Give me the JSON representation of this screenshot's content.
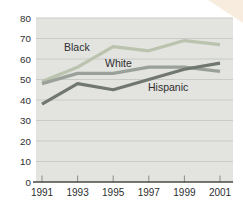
{
  "chart_data": {
    "type": "line",
    "title": "",
    "xlabel": "",
    "ylabel": "",
    "categories": [
      "1991",
      "1993",
      "1995",
      "1997",
      "1999",
      "2001"
    ],
    "series": [
      {
        "name": "Black",
        "values": [
          49,
          56,
          66,
          64,
          69,
          67
        ],
        "color": "#b9c3ae"
      },
      {
        "name": "White",
        "values": [
          48,
          53,
          53,
          56,
          56,
          54
        ],
        "color": "#99a198"
      },
      {
        "name": "Hispanic",
        "values": [
          38,
          48,
          45,
          50,
          55,
          58
        ],
        "color": "#70776f"
      }
    ],
    "ylim": [
      0,
      80
    ],
    "ytick_step": 10,
    "yticks": [
      "0",
      "10",
      "20",
      "30",
      "40",
      "50",
      "60",
      "70",
      "80"
    ],
    "grid": true,
    "legend_position": "inline-labels",
    "colors": {
      "page_background": "#ffffff",
      "plot_background": "#e3e3e0",
      "gridline": "#c9ccc6",
      "axis": "#4a4a46",
      "tick": "#8b8b87",
      "text": "#2e2e2e",
      "corner_accent": "#f8ecdf"
    }
  }
}
